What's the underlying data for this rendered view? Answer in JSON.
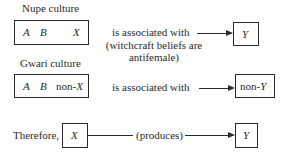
{
  "nupe": {
    "title": "Nupe culture",
    "box": {
      "a": "A",
      "b": "B",
      "x": "X"
    },
    "relation": "is associated with",
    "note_line1": "(witchcraft beliefs are",
    "note_line2": "antifemale)",
    "result": "Y"
  },
  "gwari": {
    "title": "Gwari culture",
    "box": {
      "a": "A",
      "b": "B",
      "x_prefix": "non-",
      "x": "X"
    },
    "relation": "is associated with",
    "result_prefix": "non-",
    "result": "Y"
  },
  "conclusion": {
    "lead": "Therefore,",
    "cause": "X",
    "relation": "(produces)",
    "effect": "Y"
  }
}
